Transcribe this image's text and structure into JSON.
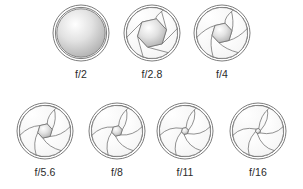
{
  "figure": {
    "name": "camera-aperture-f-stop-chart",
    "background_color": "#ffffff",
    "stroke_color": "#6e6e6e",
    "label_color": "#2b2b2b",
    "blade_count": 6
  },
  "chart_data": {
    "type": "diagram",
    "title": "",
    "categories": [
      "f/2",
      "f/2.8",
      "f/4",
      "f/5.6",
      "f/8",
      "f/11",
      "f/16"
    ],
    "values": [
      1.0,
      0.62,
      0.44,
      0.31,
      0.22,
      0.16,
      0.11
    ],
    "xlabel": "",
    "ylabel": "relative aperture opening diameter"
  },
  "rows": [
    {
      "id": "row-1",
      "y_center": 33,
      "label_y": 68,
      "apertures": [
        {
          "label": "f/2",
          "cx": 81,
          "r": 28,
          "opening": 0.94,
          "fully_open": true
        },
        {
          "label": "f/2.8",
          "cx": 152,
          "r": 28,
          "opening": 0.58,
          "fully_open": false
        },
        {
          "label": "f/4",
          "cx": 222,
          "r": 28,
          "opening": 0.4,
          "fully_open": false
        }
      ]
    },
    {
      "id": "row-2",
      "y_center": 131,
      "label_y": 166,
      "apertures": [
        {
          "label": "f/5.6",
          "cx": 45,
          "r": 28,
          "opening": 0.29,
          "fully_open": false
        },
        {
          "label": "f/8",
          "cx": 117,
          "r": 28,
          "opening": 0.21,
          "fully_open": false
        },
        {
          "label": "f/11",
          "cx": 185,
          "r": 28,
          "opening": 0.14,
          "fully_open": false
        },
        {
          "label": "f/16",
          "cx": 258,
          "r": 28,
          "opening": 0.1,
          "fully_open": false
        }
      ]
    }
  ]
}
